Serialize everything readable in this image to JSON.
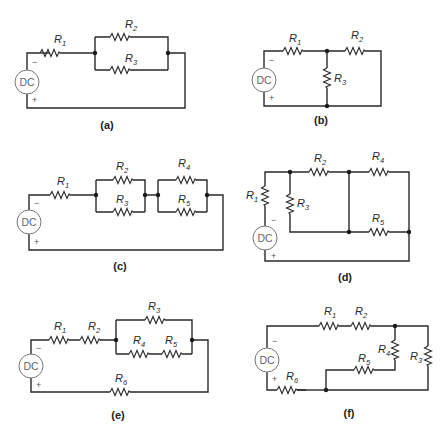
{
  "figure": {
    "source_label": "DC",
    "polarity": {
      "negative": "−",
      "positive": "+"
    },
    "panels": [
      {
        "id": "a",
        "caption": "(a)",
        "resistors": [
          "R1",
          "R2",
          "R3"
        ],
        "topology": "R1 in series with (R2 ∥ R3)"
      },
      {
        "id": "b",
        "caption": "(b)",
        "resistors": [
          "R1",
          "R2",
          "R3"
        ],
        "topology": "R1 in series with (R2 ∥ R3)"
      },
      {
        "id": "c",
        "caption": "(c)",
        "resistors": [
          "R1",
          "R2",
          "R3",
          "R4",
          "R5"
        ],
        "topology": "R1 + (R2 ∥ R3) + (R4 ∥ R5)"
      },
      {
        "id": "d",
        "caption": "(d)",
        "resistors": [
          "R1",
          "R2",
          "R3",
          "R4",
          "R5"
        ],
        "topology": "R1 + (R3 ∥ R2) + (R4 ∥ R5)"
      },
      {
        "id": "e",
        "caption": "(e)",
        "resistors": [
          "R1",
          "R2",
          "R3",
          "R4",
          "R5",
          "R6"
        ],
        "topology": "R1 + R2 + (R3 ∥ (R4 + R5)) + R6"
      },
      {
        "id": "f",
        "caption": "(f)",
        "resistors": [
          "R1",
          "R2",
          "R3",
          "R4",
          "R5",
          "R6"
        ],
        "topology": "R1 + R2 + (R3 ∥ (R4 + R5)) + R6"
      }
    ]
  },
  "labels": {
    "R": "R",
    "s1": "1",
    "s2": "2",
    "s3": "3",
    "s4": "4",
    "s5": "5",
    "s6": "6"
  }
}
